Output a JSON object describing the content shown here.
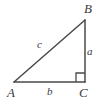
{
  "figure": {
    "type": "right-triangle-diagram",
    "background_color": "#ffffff",
    "stroke_color": "#4a4a4a",
    "label_color": "#3a3a3a",
    "vertices": [
      {
        "name": "A",
        "label": "A",
        "x": 14,
        "y": 82
      },
      {
        "name": "B",
        "label": "B",
        "x": 85,
        "y": 20
      },
      {
        "name": "C",
        "label": "C",
        "x": 85,
        "y": 82
      }
    ],
    "sides": [
      {
        "name": "a",
        "label": "a",
        "between": "B-C",
        "orientation": "vertical"
      },
      {
        "name": "b",
        "label": "b",
        "between": "A-C",
        "orientation": "horizontal"
      },
      {
        "name": "c",
        "label": "c",
        "between": "A-B",
        "orientation": "hypotenuse"
      }
    ],
    "right_angle": {
      "at_vertex": "C",
      "marker": "square",
      "size": 9
    }
  }
}
